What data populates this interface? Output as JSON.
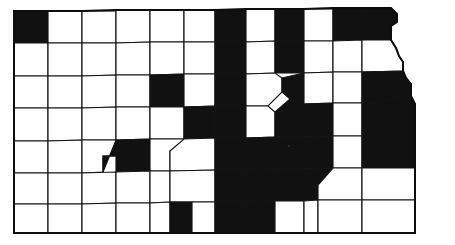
{
  "map": {
    "title": "Kansas county distribution map",
    "region": "Kansas",
    "type": "choropleth",
    "shaded_label": "shaded county",
    "unshaded_label": "unshaded county",
    "colors": {
      "shaded": "#111111",
      "unshaded": "#ffffff",
      "border": "#0d0d0d",
      "background": "#ffffff"
    },
    "counts": {
      "shaded": 58,
      "unshaded": 47,
      "total": 105
    },
    "grid": {
      "columns": 12,
      "rows": 7,
      "x_edges": [
        14,
        48,
        82,
        116,
        150,
        184,
        215,
        246,
        275,
        304,
        333,
        362,
        391
      ],
      "y_edges": [
        10,
        42,
        75,
        107,
        140,
        172,
        203,
        233
      ]
    },
    "rows": [
      {
        "index": 1,
        "cells": [
          {
            "col": 1,
            "shaded": true
          },
          {
            "col": 2,
            "shaded": false
          },
          {
            "col": 3,
            "shaded": false
          },
          {
            "col": 4,
            "shaded": false
          },
          {
            "col": 5,
            "shaded": false
          },
          {
            "col": 6,
            "shaded": false
          },
          {
            "col": 7,
            "shaded": true
          },
          {
            "col": 8,
            "shaded": false
          },
          {
            "col": 9,
            "shaded": true
          },
          {
            "col": 10,
            "shaded": false
          },
          {
            "col": 11,
            "shaded": true
          },
          {
            "col": 12,
            "shaded": true
          }
        ]
      },
      {
        "index": 2,
        "cells": [
          {
            "col": 1,
            "shaded": false
          },
          {
            "col": 2,
            "shaded": false
          },
          {
            "col": 3,
            "shaded": false
          },
          {
            "col": 4,
            "shaded": false
          },
          {
            "col": 5,
            "shaded": false
          },
          {
            "col": 6,
            "shaded": false
          },
          {
            "col": 7,
            "shaded": true
          },
          {
            "col": 8,
            "shaded": false
          },
          {
            "col": 9,
            "shaded": true
          },
          {
            "col": 10,
            "shaded": false
          },
          {
            "col": 11,
            "shaded": false
          },
          {
            "col": 12,
            "shaded": false
          }
        ]
      },
      {
        "index": 3,
        "cells": [
          {
            "col": 1,
            "shaded": false
          },
          {
            "col": 2,
            "shaded": false
          },
          {
            "col": 3,
            "shaded": false
          },
          {
            "col": 4,
            "shaded": false
          },
          {
            "col": 5,
            "shaded": true
          },
          {
            "col": 6,
            "shaded": false
          },
          {
            "col": 7,
            "shaded": true
          },
          {
            "col": 8,
            "shaded": false
          },
          {
            "col": 9,
            "shaded": true
          },
          {
            "col": 10,
            "shaded": false
          },
          {
            "col": 11,
            "shaded": false
          },
          {
            "col": 12,
            "shaded": true
          }
        ]
      },
      {
        "index": 4,
        "cells": [
          {
            "col": 1,
            "shaded": false
          },
          {
            "col": 2,
            "shaded": false
          },
          {
            "col": 3,
            "shaded": false
          },
          {
            "col": 4,
            "shaded": false
          },
          {
            "col": 5,
            "shaded": false
          },
          {
            "col": 6,
            "shaded": true
          },
          {
            "col": 7,
            "shaded": true
          },
          {
            "col": 8,
            "shaded": false
          },
          {
            "col": 9,
            "shaded": true
          },
          {
            "col": 10,
            "shaded": true
          },
          {
            "col": 11,
            "shaded": false
          },
          {
            "col": 12,
            "shaded": true
          }
        ]
      },
      {
        "index": 5,
        "cells": [
          {
            "col": 1,
            "shaded": false
          },
          {
            "col": 2,
            "shaded": false
          },
          {
            "col": 3,
            "shaded": false
          },
          {
            "col": 4,
            "shaded": true
          },
          {
            "col": 5,
            "shaded": false
          },
          {
            "col": 6,
            "shaded": false
          },
          {
            "col": 7,
            "shaded": true
          },
          {
            "col": 8,
            "shaded": true
          },
          {
            "col": 9,
            "shaded": true
          },
          {
            "col": 10,
            "shaded": true
          },
          {
            "col": 11,
            "shaded": false
          },
          {
            "col": 12,
            "shaded": true
          }
        ]
      },
      {
        "index": 6,
        "cells": [
          {
            "col": 1,
            "shaded": false
          },
          {
            "col": 2,
            "shaded": false
          },
          {
            "col": 3,
            "shaded": false
          },
          {
            "col": 4,
            "shaded": false
          },
          {
            "col": 5,
            "shaded": false
          },
          {
            "col": 6,
            "shaded": false
          },
          {
            "col": 7,
            "shaded": true
          },
          {
            "col": 8,
            "shaded": true
          },
          {
            "col": 9,
            "shaded": true
          },
          {
            "col": 10,
            "shaded": true
          },
          {
            "col": 11,
            "shaded": false
          },
          {
            "col": 12,
            "shaded": false
          }
        ]
      },
      {
        "index": 7,
        "cells": [
          {
            "col": 1,
            "shaded": false
          },
          {
            "col": 2,
            "shaded": false
          },
          {
            "col": 3,
            "shaded": false
          },
          {
            "col": 4,
            "shaded": false
          },
          {
            "col": 5,
            "shaded": false
          },
          {
            "col": 6,
            "shaded": true
          },
          {
            "col": 7,
            "shaded": false
          },
          {
            "col": 8,
            "shaded": true
          },
          {
            "col": 9,
            "shaded": true
          },
          {
            "col": 10,
            "shaded": false
          },
          {
            "col": 11,
            "shaded": false
          },
          {
            "col": 12,
            "shaded": false
          }
        ]
      }
    ]
  }
}
